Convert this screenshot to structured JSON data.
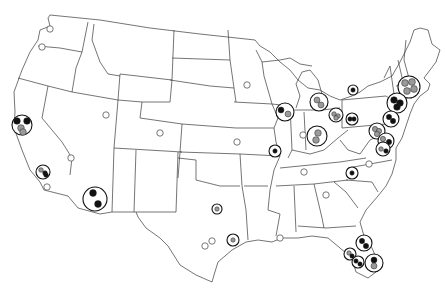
{
  "figure": {
    "caption_partial": "",
    "type": "US map with site glyphs",
    "colors": {
      "outline": "#3a3a3a",
      "black": "#111111",
      "gray": "#9a9a9a",
      "white": "#ffffff",
      "ring": "#111111"
    }
  },
  "markers": {
    "empty": [
      {
        "name": "seattle",
        "x": 50,
        "y": 29
      },
      {
        "name": "portland",
        "x": 42,
        "y": 47
      },
      {
        "name": "salt-lake",
        "x": 106,
        "y": 115
      },
      {
        "name": "denver",
        "x": 160,
        "y": 133
      },
      {
        "name": "kansas-city",
        "x": 237,
        "y": 142
      },
      {
        "name": "minneapolis",
        "x": 247,
        "y": 85
      },
      {
        "name": "las-vegas",
        "x": 71,
        "y": 158
      },
      {
        "name": "san-diego",
        "x": 47,
        "y": 187
      },
      {
        "name": "san-antonio",
        "x": 212,
        "y": 241
      },
      {
        "name": "austin",
        "x": 205,
        "y": 246
      },
      {
        "name": "indianapolis",
        "x": 303,
        "y": 135
      },
      {
        "name": "nashville",
        "x": 304,
        "y": 172
      },
      {
        "name": "atlanta",
        "x": 326,
        "y": 195
      },
      {
        "name": "raleigh",
        "x": 369,
        "y": 164
      },
      {
        "name": "new-orleans",
        "x": 280,
        "y": 238
      }
    ],
    "glyphs": [
      {
        "name": "san-francisco",
        "x": 22,
        "y": 125,
        "r": 10,
        "dots": [
          [
            "b",
            -5,
            -4
          ],
          [
            "b",
            5,
            -4
          ],
          [
            "g",
            -1,
            3
          ],
          [
            "g",
            1,
            7
          ]
        ]
      },
      {
        "name": "los-angeles",
        "x": 43,
        "y": 172,
        "r": 7,
        "dots": [
          [
            "g",
            -2,
            -2
          ],
          [
            "b",
            2,
            1
          ],
          [
            "b",
            3,
            3
          ]
        ]
      },
      {
        "name": "phoenix",
        "x": 95,
        "y": 199,
        "r": 12,
        "dots": [
          [
            "b",
            -2,
            -6
          ],
          [
            "b",
            3,
            5
          ]
        ]
      },
      {
        "name": "dallas",
        "x": 217,
        "y": 209,
        "r": 5,
        "dots": [
          [
            "g",
            0,
            0
          ]
        ]
      },
      {
        "name": "houston",
        "x": 233,
        "y": 240,
        "r": 6,
        "dots": [
          [
            "g",
            0,
            0
          ]
        ]
      },
      {
        "name": "chicago",
        "x": 285,
        "y": 112,
        "r": 9,
        "dots": [
          [
            "b",
            -4,
            -2
          ],
          [
            "g",
            3,
            2
          ]
        ]
      },
      {
        "name": "st-louis",
        "x": 275,
        "y": 151,
        "r": 6,
        "dots": [
          [
            "b",
            0,
            0
          ]
        ]
      },
      {
        "name": "detroit",
        "x": 319,
        "y": 102,
        "r": 9,
        "dots": [
          [
            "g",
            -2,
            -2
          ],
          [
            "g",
            2,
            3
          ]
        ]
      },
      {
        "name": "cleveland",
        "x": 336,
        "y": 115,
        "r": 7,
        "dots": [
          [
            "g",
            -2,
            -1
          ],
          [
            "g",
            2,
            1
          ],
          [
            "g",
            0,
            3
          ]
        ]
      },
      {
        "name": "cincinnati",
        "x": 317,
        "y": 136,
        "r": 10,
        "dots": [
          [
            "g",
            1,
            -3
          ],
          [
            "g",
            -1,
            4
          ]
        ]
      },
      {
        "name": "pittsburgh",
        "x": 352,
        "y": 119,
        "r": 6,
        "dots": [
          [
            "b",
            -2,
            0
          ],
          [
            "b",
            2,
            0
          ]
        ]
      },
      {
        "name": "buffalo",
        "x": 353,
        "y": 90,
        "r": 5,
        "dots": [
          [
            "b",
            0,
            0
          ]
        ]
      },
      {
        "name": "boston",
        "x": 409,
        "y": 87,
        "r": 11,
        "dots": [
          [
            "g",
            -4,
            -4
          ],
          [
            "g",
            3,
            -5
          ],
          [
            "g",
            5,
            2
          ],
          [
            "g",
            -2,
            4
          ]
        ]
      },
      {
        "name": "new-york",
        "x": 397,
        "y": 103,
        "r": 10,
        "dots": [
          [
            "b",
            -3,
            -3
          ],
          [
            "b",
            3,
            0
          ],
          [
            "b",
            0,
            4
          ]
        ]
      },
      {
        "name": "philadelphia",
        "x": 391,
        "y": 119,
        "r": 8,
        "dots": [
          [
            "b",
            -2,
            -2
          ],
          [
            "b",
            2,
            2
          ]
        ]
      },
      {
        "name": "washington",
        "x": 377,
        "y": 131,
        "r": 8,
        "dots": [
          [
            "g",
            -2,
            -2
          ],
          [
            "g",
            2,
            0
          ],
          [
            "g",
            0,
            3
          ]
        ]
      },
      {
        "name": "baltimore",
        "x": 386,
        "y": 141,
        "r": 8,
        "dots": [
          [
            "g",
            -3,
            -2
          ],
          [
            "b",
            3,
            1
          ]
        ]
      },
      {
        "name": "richmond",
        "x": 383,
        "y": 149,
        "r": 7,
        "dots": [
          [
            "g",
            -2,
            0
          ],
          [
            "b",
            3,
            2
          ]
        ]
      },
      {
        "name": "charlotte",
        "x": 352,
        "y": 173,
        "r": 6,
        "dots": [
          [
            "b",
            0,
            0
          ]
        ]
      },
      {
        "name": "jacksonville",
        "x": 364,
        "y": 243,
        "r": 8,
        "dots": [
          [
            "b",
            -2,
            -2
          ],
          [
            "b",
            2,
            3
          ]
        ]
      },
      {
        "name": "tampa",
        "x": 350,
        "y": 254,
        "r": 6,
        "dots": [
          [
            "g",
            -1,
            -1
          ],
          [
            "b",
            2,
            2
          ]
        ]
      },
      {
        "name": "orlando",
        "x": 358,
        "y": 262,
        "r": 6,
        "dots": [
          [
            "b",
            -2,
            -1
          ],
          [
            "b",
            2,
            2
          ]
        ]
      },
      {
        "name": "miami",
        "x": 374,
        "y": 263,
        "r": 9,
        "dots": [
          [
            "b",
            0,
            -3
          ],
          [
            "g",
            0,
            3
          ]
        ]
      }
    ]
  }
}
